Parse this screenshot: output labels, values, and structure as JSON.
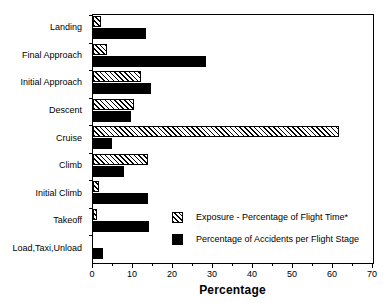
{
  "chart_data": {
    "type": "bar",
    "orientation": "horizontal",
    "title": "",
    "xlabel": "Percentage",
    "ylabel": "",
    "xlim": [
      0,
      70
    ],
    "xticks": [
      0,
      10,
      20,
      30,
      40,
      50,
      60,
      70
    ],
    "xtick_labels": [
      "0",
      "10",
      "20",
      "30",
      "40",
      "50",
      "60",
      "70"
    ],
    "minor_tick_step": 5,
    "grid": false,
    "legend_position": "inside-lower-right",
    "categories": [
      "Landing",
      "Final Approach",
      "Initial Approach",
      "Descent",
      "Cruise",
      "Climb",
      "Initial Climb",
      "Takeoff",
      "Load,Taxi,Unload"
    ],
    "series": [
      {
        "name": "Exposure - Percentage of Flight Time*",
        "pattern": "diagonal-hatch",
        "color": "#000000",
        "values": [
          2.0,
          3.5,
          12.0,
          10.3,
          61.5,
          13.7,
          1.5,
          1.0,
          0.0
        ]
      },
      {
        "name": "Percentage of Accidents per Flight Stage",
        "pattern": "solid",
        "color": "#000000",
        "values": [
          13.2,
          28.2,
          14.5,
          9.5,
          4.8,
          7.7,
          13.7,
          14.0,
          2.5
        ]
      }
    ],
    "footnote_marker": "*"
  },
  "legend": {
    "items": [
      {
        "label": "Exposure - Percentage of Flight Time*",
        "swatch": "diagonal-hatch"
      },
      {
        "label": "Percentage of Accidents per Flight Stage",
        "swatch": "solid-black"
      }
    ]
  },
  "colors": {
    "axis": "#000000",
    "background": "#ffffff",
    "bar_accidents": "#000000",
    "bar_exposure_outline": "#000000"
  }
}
